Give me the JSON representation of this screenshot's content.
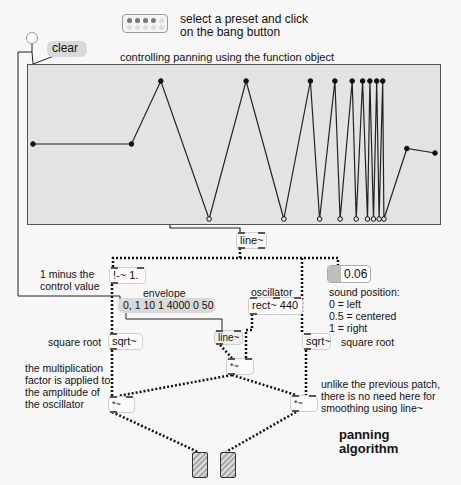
{
  "header": {
    "preset_hint_line1": "select a preset and click",
    "preset_hint_line2": "on the bang button",
    "function_title": "controlling panning using the function object"
  },
  "clear_message": "clear",
  "function_object": {
    "points": [
      {
        "x": 0.0,
        "y": 0.5,
        "filled": true
      },
      {
        "x": 0.245,
        "y": 0.5,
        "filled": true
      },
      {
        "x": 0.318,
        "y": 0.92,
        "filled": true
      },
      {
        "x": 0.438,
        "y": 0.0,
        "filled": false
      },
      {
        "x": 0.53,
        "y": 0.92,
        "filled": true
      },
      {
        "x": 0.624,
        "y": 0.0,
        "filled": false
      },
      {
        "x": 0.69,
        "y": 0.92,
        "filled": true
      },
      {
        "x": 0.713,
        "y": 0.0,
        "filled": false
      },
      {
        "x": 0.751,
        "y": 0.92,
        "filled": true
      },
      {
        "x": 0.764,
        "y": 0.0,
        "filled": false
      },
      {
        "x": 0.794,
        "y": 0.92,
        "filled": true
      },
      {
        "x": 0.804,
        "y": 0.0,
        "filled": false
      },
      {
        "x": 0.82,
        "y": 0.92,
        "filled": true
      },
      {
        "x": 0.832,
        "y": 0.0,
        "filled": false
      },
      {
        "x": 0.838,
        "y": 0.92,
        "filled": true
      },
      {
        "x": 0.847,
        "y": 0.0,
        "filled": false
      },
      {
        "x": 0.855,
        "y": 0.92,
        "filled": true
      },
      {
        "x": 0.861,
        "y": 0.0,
        "filled": false
      },
      {
        "x": 0.87,
        "y": 0.92,
        "filled": true
      },
      {
        "x": 0.873,
        "y": 0.0,
        "filled": false
      },
      {
        "x": 0.93,
        "y": 0.47,
        "filled": true
      },
      {
        "x": 1.0,
        "y": 0.44,
        "filled": true
      }
    ]
  },
  "objects": {
    "line_top": "line~",
    "one_minus": "!-~ 1.",
    "envelope_msg": "0, 1 10 1 4000 0 50",
    "oscillator": "rect~ 440",
    "sound_position_value": "0.06",
    "sqrt_left": "sqrt~",
    "sqrt_right": "sqrt~",
    "line_small": "line~",
    "mult_mid": "*~",
    "mult_left": "*~",
    "mult_right": "*~"
  },
  "labels": {
    "one_minus_line1": "1 minus the",
    "one_minus_line2": "control value",
    "envelope": "envelope",
    "oscillator": "oscillator",
    "sound_position": [
      "sound position:",
      "0 = left",
      "0.5 = centered",
      "1 = right"
    ],
    "square_root_left": "square root",
    "square_root_right": "square root",
    "multiplication_note": [
      "the multiplication",
      "factor is applied to",
      "the amplitude of",
      "the oscillator"
    ],
    "unlike_note": [
      "unlike the previous patch,",
      "there is no need here for",
      "smoothing using line~"
    ],
    "panning_title_line1": "panning",
    "panning_title_line2": "algorithm"
  },
  "colors": {
    "background": "#f7f7f7",
    "function_bg": "#e3e3e3",
    "message_bg": "#d9d9d9",
    "wire": "#222222"
  }
}
